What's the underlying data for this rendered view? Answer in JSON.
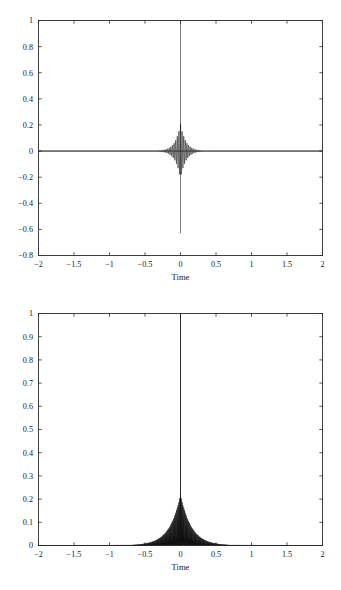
{
  "document": {
    "kind": "figure-pair",
    "background_color": "#ffffff",
    "ink_color": "#111111",
    "axis_color": "#2b2b2b"
  },
  "chart_data": [
    {
      "id": "top-plot",
      "type": "line",
      "title": "",
      "xlabel": "Time",
      "ylabel": "",
      "xlim": [
        -2,
        2
      ],
      "ylim": [
        -0.8,
        1
      ],
      "grid": false,
      "legend": null,
      "xticks": [
        -2,
        -1.5,
        -1,
        -0.5,
        0,
        0.5,
        1,
        1.5,
        2
      ],
      "xticklabels": [
        "-2",
        "-1.5",
        "-1",
        "-0.5",
        "0",
        "0.5",
        "1",
        "1.5",
        "2"
      ],
      "yticks": [
        -0.8,
        -0.6,
        -0.4,
        -0.2,
        0,
        0.2,
        0.4,
        0.6,
        0.8,
        1
      ],
      "yticklabels": [
        "-0.8",
        "-0.6",
        "-0.4",
        "-0.2",
        "0",
        "0.2",
        "0.4",
        "0.6",
        "0.8",
        "1"
      ],
      "description": "Oscillating impulse response centred at t=0: dense high-frequency oscillation whose envelope decays rapidly away from the origin, with a tall narrow positive spike reaching 1 and a negative excursion to about -0.63 at t=0.",
      "series": [
        {
          "name": "impulse response",
          "peak_positive": 1.0,
          "peak_negative": -0.63,
          "envelope_at_0": 0.21,
          "oscillation_frequency_hz": 44,
          "envelope_decay_rate": 13.5,
          "sample_count": 2400,
          "x_range": [
            -2,
            2
          ]
        }
      ]
    },
    {
      "id": "bottom-plot",
      "type": "area",
      "title": "",
      "xlabel": "Time",
      "ylabel": "",
      "xlim": [
        -2,
        2
      ],
      "ylim": [
        0,
        1
      ],
      "grid": false,
      "legend": null,
      "xticks": [
        -2,
        -1.5,
        -1,
        -0.5,
        0,
        0.5,
        1,
        1.5,
        2
      ],
      "xticklabels": [
        "-2",
        "-1.5",
        "-1",
        "-0.5",
        "0",
        "0.5",
        "1",
        "1.5",
        "2"
      ],
      "yticks": [
        0,
        0.1,
        0.2,
        0.3,
        0.4,
        0.5,
        0.6,
        0.7,
        0.8,
        0.9,
        1
      ],
      "yticklabels": [
        "0",
        "0.1",
        "0.2",
        "0.3",
        "0.4",
        "0.5",
        "0.6",
        "0.7",
        "0.8",
        "0.9",
        "1"
      ],
      "description": "Magnitude (envelope) of the same signal: a single very narrow spike at t=0 reaching 1, sitting on a shoulder of height about 0.22 that decays smoothly to near zero by |t| = 1.",
      "series": [
        {
          "name": "envelope magnitude",
          "peak_value": 1.0,
          "shoulder_value": 0.22,
          "envelope_decay_rate": 6.5,
          "spike_half_width": 0.006,
          "sample_count": 2400,
          "x_range": [
            -2,
            2
          ]
        }
      ]
    }
  ]
}
